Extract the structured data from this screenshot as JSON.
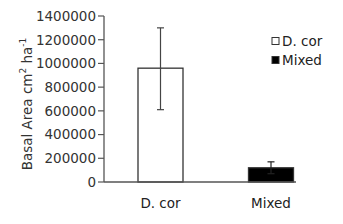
{
  "chart_data": {
    "type": "bar",
    "title": "",
    "xlabel": "",
    "ylabel": "Basal Area cm² ha⁻¹",
    "ylabel_parts": {
      "base": "Basal Area cm",
      "sup1": "2",
      "mid": " ha",
      "sup2": "-1"
    },
    "ylim": [
      0,
      1400000
    ],
    "yticks": [
      0,
      200000,
      400000,
      600000,
      800000,
      1000000,
      1200000,
      1400000
    ],
    "ytick_labels": [
      "0",
      "200000",
      "400000",
      "600000",
      "800000",
      "1000000",
      "1200000",
      "1400000"
    ],
    "categories": [
      "D. cor",
      "Mixed"
    ],
    "values": [
      960000,
      120000
    ],
    "error_upper": [
      1300000,
      170000
    ],
    "error_lower": [
      610000,
      70000
    ],
    "colors": [
      "#ffffff",
      "#000000"
    ],
    "edge_color": "#333333",
    "grid": false,
    "legend": {
      "position": "upper right",
      "entries": [
        {
          "label": "D. cor",
          "color": "#ffffff"
        },
        {
          "label": "Mixed",
          "color": "#000000"
        }
      ]
    }
  }
}
